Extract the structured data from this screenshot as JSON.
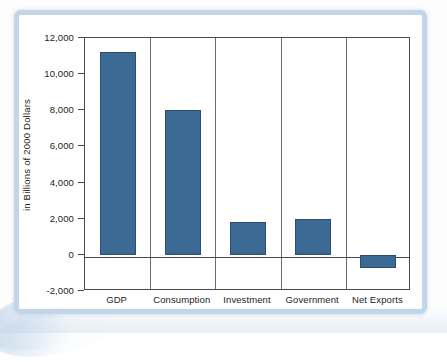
{
  "figure": {
    "frame_color": "#c2d6e8",
    "background_color": "#ffffff"
  },
  "chart_data": {
    "type": "bar",
    "title": "",
    "subtitle": "",
    "xlabel": "",
    "ylabel": "in Billions of 2000 Dollars",
    "categories": [
      "GDP",
      "Consumption",
      "Investment",
      "Government",
      "Net Exports"
    ],
    "values": [
      11200,
      8000,
      1800,
      2000,
      -750
    ],
    "series": [
      {
        "name": "Components of GDP",
        "values": [
          11200,
          8000,
          1800,
          2000,
          -750
        ]
      }
    ],
    "ylim": [
      -2000,
      12000
    ],
    "ytick_values": [
      12000,
      10000,
      8000,
      6000,
      4000,
      2000,
      0,
      -2000
    ],
    "ytick_labels": [
      "12,000",
      "10,000",
      "8,000",
      "6,000",
      "4,000",
      "2,000",
      "0",
      "-2,000"
    ],
    "grid": false,
    "category_separators": true,
    "legend": false,
    "legend_position": "none",
    "bar_color": "#3d6a94",
    "bar_edge_color": "#2c4f70",
    "axis_color": "#4a4a4a",
    "zero_line": 0,
    "annotations": []
  }
}
